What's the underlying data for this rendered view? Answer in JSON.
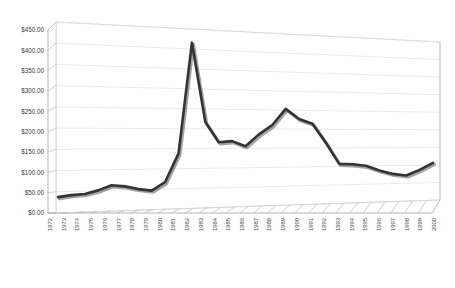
{
  "chart_data": {
    "type": "line",
    "title": "",
    "subtitle": "",
    "xlabel": "",
    "ylabel": "",
    "ylim": [
      0,
      450
    ],
    "ytick_step": 50,
    "grid": true,
    "legend": "none",
    "style": "3d-line-chart",
    "line_color": "#333333",
    "gridline_color": "#d9d9dd",
    "background_color": "#ffffff",
    "value_prefix": "$",
    "ytick_labels": [
      "$0.00",
      "$50.00",
      "$100.00",
      "$150.00",
      "$200.00",
      "$250.00",
      "$300.00",
      "$350.00",
      "$400.00",
      "$450.00"
    ],
    "ytick_values": [
      0,
      50,
      100,
      150,
      200,
      250,
      300,
      350,
      400,
      450
    ],
    "categories": [
      "1972",
      "1973",
      "1974",
      "1975",
      "1976",
      "1977",
      "1978",
      "1979",
      "1980",
      "1981",
      "1982",
      "1983",
      "1984",
      "1985",
      "1986",
      "1987",
      "1988",
      "1989",
      "1990",
      "1991",
      "1992",
      "1993",
      "1994",
      "1995",
      "1996",
      "1997",
      "1998",
      "1999",
      "2000"
    ],
    "values": [
      38,
      42,
      44,
      52,
      64,
      60,
      52,
      47,
      68,
      140,
      422,
      218,
      165,
      167,
      153,
      182,
      205,
      245,
      218,
      205,
      155,
      100,
      98,
      93,
      80,
      70,
      65,
      78,
      95
    ],
    "series": [
      {
        "name": "Series 1",
        "values": [
          38,
          42,
          44,
          52,
          64,
          60,
          52,
          47,
          68,
          140,
          422,
          218,
          165,
          167,
          153,
          182,
          205,
          245,
          218,
          205,
          155,
          100,
          98,
          93,
          80,
          70,
          65,
          78,
          95
        ]
      }
    ],
    "annotations": []
  }
}
